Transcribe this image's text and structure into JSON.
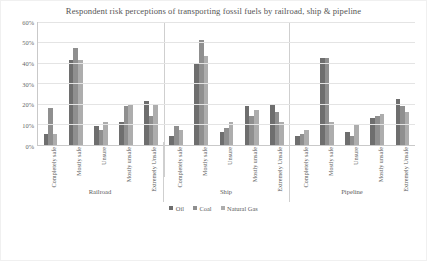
{
  "chart_data": {
    "type": "bar",
    "title": "Respondent risk perceptions of transporting fossil fuels by railroad, ship & pipeline",
    "xlabel": "",
    "ylabel": "",
    "ylim": [
      0,
      60
    ],
    "ytick_labels": [
      "60%",
      "50%",
      "40%",
      "30%",
      "20%",
      "10%",
      "0%"
    ],
    "ytick_values": [
      60,
      50,
      40,
      30,
      20,
      10,
      0
    ],
    "grid": true,
    "legend_position": "bottom",
    "grouped": true,
    "group_labels": [
      "Railroad",
      "Ship",
      "Pipeline"
    ],
    "categories": [
      "Completely safe",
      "Mostly safe",
      "Unsure",
      "Mostly unsafe",
      "Extremely Unsafe"
    ],
    "series": [
      {
        "name": "Oil",
        "color": "#6e6e6e",
        "groups": {
          "Railroad": [
            5,
            41,
            9,
            11,
            21
          ],
          "Ship": [
            4,
            40,
            6,
            19,
            20
          ],
          "Pipeline": [
            4,
            42,
            6,
            13,
            22
          ]
        }
      },
      {
        "name": "Coal",
        "color": "#8f8f8f",
        "groups": {
          "Railroad": [
            18,
            47,
            7,
            19,
            14
          ],
          "Ship": [
            9,
            51,
            8,
            14,
            16
          ],
          "Pipeline": [
            5,
            42,
            4,
            14,
            19
          ]
        }
      },
      {
        "name": "Natural Gas",
        "color": "#adadad",
        "groups": {
          "Railroad": [
            5,
            41,
            11,
            20,
            20
          ],
          "Ship": [
            7,
            43,
            11,
            17,
            11
          ],
          "Pipeline": [
            7,
            11,
            10,
            15,
            16
          ]
        }
      }
    ]
  },
  "chart": {
    "title": "Respondent risk perceptions of transporting fossil fuels by railroad, ship & pipeline",
    "y_ticks": [
      "60%",
      "50%",
      "40%",
      "30%",
      "20%",
      "10%",
      "0%"
    ],
    "groups": [
      {
        "label": "Railroad",
        "categories": [
          {
            "label": "Completely safe",
            "values": [
              5,
              18,
              5
            ]
          },
          {
            "label": "Mostly safe",
            "values": [
              41,
              47,
              41
            ]
          },
          {
            "label": "Unsure",
            "values": [
              9,
              7,
              11
            ]
          },
          {
            "label": "Mostly unsafe",
            "values": [
              11,
              19,
              20
            ]
          },
          {
            "label": "Extremely Unsafe",
            "values": [
              21,
              14,
              20
            ]
          }
        ]
      },
      {
        "label": "Ship",
        "categories": [
          {
            "label": "Completely safe",
            "values": [
              4,
              9,
              7
            ]
          },
          {
            "label": "Mostly safe",
            "values": [
              40,
              51,
              43
            ]
          },
          {
            "label": "Unsure",
            "values": [
              6,
              8,
              11
            ]
          },
          {
            "label": "Mostly unsafe",
            "values": [
              19,
              14,
              17
            ]
          },
          {
            "label": "Extremely Unsafe",
            "values": [
              20,
              16,
              11
            ]
          }
        ]
      },
      {
        "label": "Pipeline",
        "categories": [
          {
            "label": "Completely safe",
            "values": [
              4,
              5,
              7
            ]
          },
          {
            "label": "Mostly safe",
            "values": [
              42,
              42,
              11
            ]
          },
          {
            "label": "Unsure",
            "values": [
              6,
              4,
              10
            ]
          },
          {
            "label": "Mostly unsafe",
            "values": [
              13,
              14,
              15
            ]
          },
          {
            "label": "Extremely Unsafe",
            "values": [
              22,
              19,
              16
            ]
          }
        ]
      }
    ],
    "legend": [
      {
        "label": "Oil",
        "color": "#6e6e6e"
      },
      {
        "label": "Coal",
        "color": "#8f8f8f"
      },
      {
        "label": "Natural Gas",
        "color": "#adadad"
      }
    ]
  }
}
